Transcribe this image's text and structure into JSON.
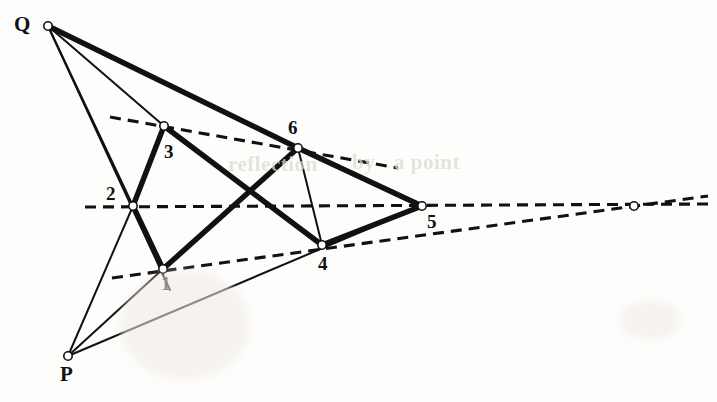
{
  "figure": {
    "type": "projective-geometry-diagram",
    "width": 717,
    "height": 402,
    "background_color": "#fdfdfc",
    "stroke_color": "#111111",
    "vertex_fill_color": "#ffffff",
    "vertex_stroke_color": "#111111"
  },
  "points": [
    {
      "id": "Q",
      "label": "Q",
      "x": 48,
      "y": 26,
      "label_x": 14,
      "label_y": 14,
      "label_size": "cap",
      "marker": true
    },
    {
      "id": "P",
      "label": "P",
      "x": 68,
      "y": 356,
      "label_x": 60,
      "label_y": 364,
      "label_size": "cap",
      "marker": true
    },
    {
      "id": "p1",
      "label": "1",
      "x": 163,
      "y": 269,
      "label_x": 161,
      "label_y": 274,
      "label_size": "num",
      "marker": true
    },
    {
      "id": "p2",
      "label": "2",
      "x": 133,
      "y": 206,
      "label_x": 106,
      "label_y": 184,
      "label_size": "num",
      "marker": true
    },
    {
      "id": "p3",
      "label": "3",
      "x": 164,
      "y": 126,
      "label_x": 164,
      "label_y": 142,
      "label_size": "num",
      "marker": true
    },
    {
      "id": "p4",
      "label": "4",
      "x": 322,
      "y": 245,
      "label_x": 318,
      "label_y": 254,
      "label_size": "num",
      "marker": true
    },
    {
      "id": "p5",
      "label": "5",
      "x": 422,
      "y": 206,
      "label_x": 427,
      "label_y": 212,
      "label_size": "num",
      "marker": true
    },
    {
      "id": "p6",
      "label": "6",
      "x": 298,
      "y": 148,
      "label_x": 288,
      "label_y": 118,
      "label_size": "num",
      "marker": true
    },
    {
      "id": "pX",
      "label": "",
      "x": 634,
      "y": 206,
      "label_x": 0,
      "label_y": 0,
      "label_size": "num",
      "marker": true
    }
  ],
  "thick_edges": [
    {
      "name": "edge-2-3",
      "from": "p2",
      "to": "p3"
    },
    {
      "name": "edge-1-2",
      "from": "p1",
      "to": "p2"
    },
    {
      "name": "edge-3-4",
      "from": "p3",
      "to": "p4"
    },
    {
      "name": "edge-1-6",
      "from": "p1",
      "to": "p6"
    },
    {
      "name": "edge-6-5",
      "from": "p6",
      "to": "p5"
    },
    {
      "name": "edge-4-5",
      "from": "p4",
      "to": "p5"
    },
    {
      "name": "edge-Q-6",
      "from": "Q",
      "to": "p6"
    }
  ],
  "thin_edges": [
    {
      "name": "line-Q-2",
      "from": "Q",
      "to": "p2"
    },
    {
      "name": "line-Q-3",
      "from": "Q",
      "to": "p3"
    },
    {
      "name": "line-Q-1-ext",
      "x1": 48,
      "y1": 26,
      "x2": 170,
      "y2": 290
    },
    {
      "name": "line-P-2",
      "from": "P",
      "to": "p2"
    },
    {
      "name": "line-P-1",
      "from": "P",
      "to": "p1"
    },
    {
      "name": "line-P-4-5",
      "x1": 68,
      "y1": 356,
      "x2": 422,
      "y2": 206
    },
    {
      "name": "line-3-2-down",
      "x1": 164,
      "y1": 126,
      "x2": 133,
      "y2": 206
    },
    {
      "name": "line-6-4",
      "x1": 298,
      "y1": 148,
      "x2": 322,
      "y2": 245
    }
  ],
  "dashed_lines": [
    {
      "name": "pascal-line-upper",
      "x1": 110,
      "y1": 117,
      "x2": 398,
      "y2": 168,
      "through": [
        "p3",
        "p6"
      ]
    },
    {
      "name": "pascal-line-middle",
      "x1": 85,
      "y1": 207,
      "x2": 708,
      "y2": 204,
      "through": [
        "p2",
        "p5",
        "pX"
      ]
    },
    {
      "name": "pascal-line-lower",
      "x1": 112,
      "y1": 278,
      "x2": 708,
      "y2": 196,
      "through": [
        "p1",
        "p4",
        "pX"
      ]
    }
  ],
  "bleed_through_text": [
    {
      "text": "reflection",
      "x": 228,
      "y": 152,
      "size": 21
    },
    {
      "text": "by",
      "x": 352,
      "y": 150,
      "size": 21
    },
    {
      "text": "a point",
      "x": 394,
      "y": 150,
      "size": 21
    }
  ]
}
